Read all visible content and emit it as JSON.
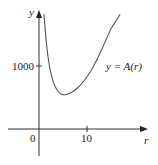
{
  "chart_data": {
    "type": "line",
    "title": "",
    "xlabel": "r",
    "ylabel": "y",
    "curve_label": "y = A(r)",
    "x_ticks": [
      {
        "value": 0,
        "label": "0"
      },
      {
        "value": 10,
        "label": "10"
      }
    ],
    "y_ticks": [
      {
        "value": 1000,
        "label": "1000"
      }
    ],
    "xlim": [
      -6.5,
      23
    ],
    "ylim": [
      -420,
      1860
    ],
    "grid": false,
    "legend": "none",
    "series": [
      {
        "name": "A(r)",
        "x": [
          1.05,
          1.5,
          2,
          2.5,
          3,
          3.5,
          4,
          4.5,
          5,
          5.5,
          6,
          7,
          8,
          9,
          10,
          11,
          12,
          13,
          14,
          15,
          16,
          16.9
        ],
        "y": [
          1820,
          1400,
          1080,
          880,
          745,
          655,
          595,
          560,
          545,
          545,
          555,
          590,
          650,
          730,
          830,
          950,
          1090,
          1250,
          1420,
          1590,
          1710,
          1820
        ]
      }
    ]
  },
  "labels": {
    "y_axis": "y",
    "x_axis": "r",
    "origin": "0",
    "x_tick_10": "10",
    "y_tick_1000": "1000",
    "curve": "y = A(r)"
  },
  "colors": {
    "axis": "#333333",
    "curve": "#555555",
    "text": "#222222"
  }
}
